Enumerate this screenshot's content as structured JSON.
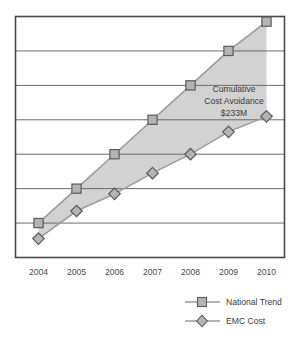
{
  "chart_data": {
    "type": "line",
    "title": "",
    "xlabel": "",
    "ylabel": "",
    "grid": true,
    "gridlines": 6,
    "y_axis_labels_shown": false,
    "ylim": [
      0,
      7
    ],
    "categories": [
      "2004",
      "2005",
      "2006",
      "2007",
      "2008",
      "2009",
      "2010"
    ],
    "series": [
      {
        "name": "National Trend",
        "marker": "square",
        "values": [
          1.0,
          2.0,
          3.0,
          4.0,
          5.0,
          6.0,
          6.85
        ]
      },
      {
        "name": "EMC Cost",
        "marker": "diamond",
        "values": [
          0.55,
          1.35,
          1.85,
          2.45,
          3.0,
          3.65,
          4.1
        ]
      }
    ],
    "fill_between": {
      "label": "Cumulative Cost Avoidance",
      "upper_series": "National Trend",
      "lower_series": "EMC Cost"
    },
    "annotations": [
      {
        "name": "cumulative-cost-avoidance",
        "lines": [
          "Cumulative",
          "Cost Avoidance",
          "$233M"
        ]
      }
    ],
    "legend": {
      "position": "bottom-right",
      "entries": [
        {
          "label": "National Trend",
          "marker": "square"
        },
        {
          "label": "EMC Cost",
          "marker": "diamond"
        }
      ]
    },
    "colors": {
      "frame": "#4a4a4a",
      "gridline": "#6b6b6b",
      "band_fill": "#d2d2d2",
      "marker_fill": "#b4b4b4",
      "marker_stroke": "#5a5a5a",
      "series_line": "#9a9a9a",
      "text": "#3c3c3c",
      "background": "#ffffff"
    }
  },
  "axis": {
    "tick_labels": [
      "2004",
      "2005",
      "2006",
      "2007",
      "2008",
      "2009",
      "2010"
    ]
  },
  "annotation": {
    "line1": "Cumulative",
    "line2": "Cost Avoidance",
    "line3": "$233M"
  },
  "legend": {
    "item1_label": "National Trend",
    "item2_label": "EMC Cost"
  }
}
